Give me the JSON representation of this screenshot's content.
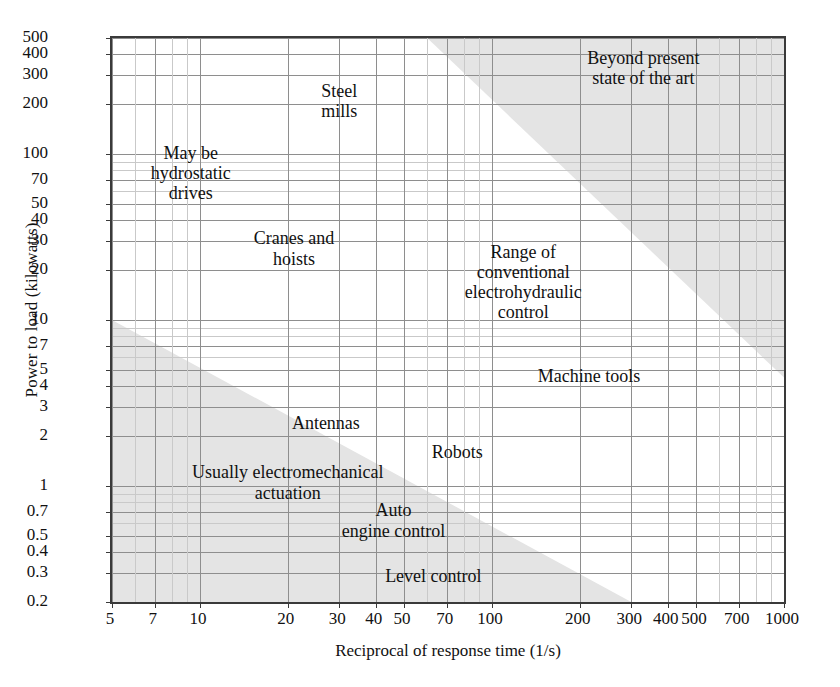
{
  "chart_data": {
    "type": "scatter",
    "title": "",
    "xlabel": "Reciprocal of response time (1/s)",
    "ylabel": "Power to load (kilowatts)",
    "xscale": "log",
    "yscale": "log",
    "xlim": [
      5,
      1000
    ],
    "ylim": [
      0.2,
      500
    ],
    "grid": true,
    "legend": "none",
    "xticks": [
      "5",
      "7",
      "10",
      "20",
      "30",
      "40",
      "50",
      "70",
      "100",
      "200",
      "300",
      "400",
      "500",
      "700",
      "1000"
    ],
    "xtick_values": [
      5,
      7,
      10,
      20,
      30,
      40,
      50,
      70,
      100,
      200,
      300,
      400,
      500,
      700,
      1000
    ],
    "yticks": [
      "500",
      "400",
      "300",
      "200",
      "100",
      "70",
      "50",
      "40",
      "30",
      "20",
      "10",
      "7",
      "5",
      "4",
      "3",
      "2",
      "1",
      "0.7",
      "0.5",
      "0.4",
      "0.3",
      "0.2"
    ],
    "ytick_values": [
      500,
      400,
      300,
      200,
      100,
      70,
      50,
      40,
      30,
      20,
      10,
      7,
      5,
      4,
      3,
      2,
      1,
      0.7,
      0.5,
      0.4,
      0.3,
      0.2
    ],
    "shaded_regions": [
      {
        "name": "beyond-present-state-of-the-art",
        "label": "Beyond present\nstate of the art",
        "color": "#e4e4e4",
        "description": "Upper-right triangular shaded band: infeasible high power / high bandwidth corner",
        "boundary_points": [
          [
            60,
            500
          ],
          [
            1000,
            4.5
          ]
        ]
      },
      {
        "name": "usually-electromechanical-actuation",
        "label": "Usually electromechanical\nactuation",
        "color": "#e4e4e4",
        "description": "Lower-left triangular shaded band: low power / low bandwidth region",
        "boundary_points": [
          [
            5,
            10
          ],
          [
            300,
            0.2
          ]
        ]
      }
    ],
    "annotations": [
      {
        "text": "Beyond present\nstate of the art",
        "x": 330,
        "y": 330,
        "lines": [
          "Beyond present",
          "state of the art"
        ]
      },
      {
        "text": "Steel\nmills",
        "x": 30,
        "y": 210,
        "lines": [
          "Steel",
          "mills"
        ]
      },
      {
        "text": "May be\nhydrostatic\ndrives",
        "x": 9.3,
        "y": 77,
        "lines": [
          "May be",
          "hydrostatic",
          "drives"
        ]
      },
      {
        "text": "Cranes and\nhoists",
        "x": 21,
        "y": 27,
        "lines": [
          "Cranes and",
          "hoists"
        ]
      },
      {
        "text": "Range of\nconventional\nelectrohydraulic\ncontrol",
        "x": 128,
        "y": 17,
        "lines": [
          "Range of",
          "conventional",
          "electrohydraulic",
          "control"
        ]
      },
      {
        "text": "Machine tools",
        "x": 215,
        "y": 4.6,
        "lines": [
          "Machine tools"
        ]
      },
      {
        "text": "Antennas",
        "x": 27,
        "y": 2.4,
        "lines": [
          "Antennas"
        ]
      },
      {
        "text": "Robots",
        "x": 76,
        "y": 1.6,
        "lines": [
          "Robots"
        ]
      },
      {
        "text": "Usually electromechanical\nactuation",
        "x": 20,
        "y": 1.05,
        "lines": [
          "Usually electromechanical",
          "actuation"
        ]
      },
      {
        "text": "Auto\nengine control",
        "x": 46,
        "y": 0.62,
        "lines": [
          "Auto",
          "engine control"
        ]
      },
      {
        "text": "Level control",
        "x": 63,
        "y": 0.285,
        "lines": [
          "Level control"
        ]
      }
    ]
  },
  "style": {
    "shade_color": "#e4e4e4",
    "grid_major": "#8e8e8e",
    "grid_minor": "#c9c9c9",
    "frame_color": "#3a3a3a",
    "text_color": "#111111",
    "background": "#ffffff"
  }
}
